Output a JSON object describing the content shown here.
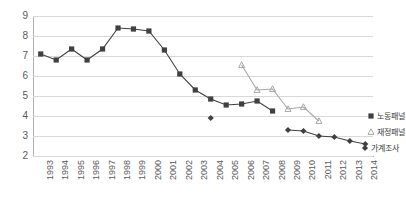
{
  "chart_data": {
    "type": "line",
    "title": "",
    "xlabel": "",
    "ylabel": "",
    "ylim": [
      2,
      9
    ],
    "yticks": [
      "2",
      "3",
      "4",
      "5",
      "6",
      "7",
      "8",
      "9"
    ],
    "grid": true,
    "legend_position": "right-inside",
    "categories": [
      "1993",
      "1994",
      "1995",
      "1996",
      "1997",
      "1998",
      "1999",
      "2000",
      "2001",
      "2002",
      "2003",
      "2004",
      "2005",
      "2006",
      "2007",
      "2008",
      "2009",
      "2010",
      "2011",
      "2012",
      "2013",
      "2014"
    ],
    "series": [
      {
        "name": "노동패널",
        "marker": "square",
        "color": "#404040",
        "values": [
          7.1,
          6.8,
          7.35,
          6.8,
          7.35,
          8.4,
          8.35,
          8.25,
          7.3,
          6.1,
          5.3,
          4.85,
          4.55,
          4.6,
          4.75,
          4.25,
          null,
          null,
          null,
          null,
          null,
          null
        ]
      },
      {
        "name": "재정패널",
        "marker": "triangle",
        "color": "#a6a6a6",
        "values": [
          null,
          null,
          null,
          null,
          null,
          null,
          null,
          null,
          null,
          null,
          null,
          null,
          null,
          6.55,
          5.3,
          5.35,
          4.35,
          4.45,
          3.75,
          null,
          null,
          null
        ]
      },
      {
        "name": "가계조사",
        "marker": "diamond",
        "color": "#404040",
        "values": [
          null,
          null,
          null,
          null,
          null,
          null,
          null,
          null,
          null,
          null,
          null,
          3.9,
          null,
          null,
          null,
          null,
          3.3,
          3.25,
          3.0,
          2.95,
          2.75,
          2.6
        ]
      }
    ]
  },
  "legend": {
    "items": [
      {
        "label": "노동패널"
      },
      {
        "label": "재정패널"
      },
      {
        "label": "가계조사"
      }
    ]
  }
}
